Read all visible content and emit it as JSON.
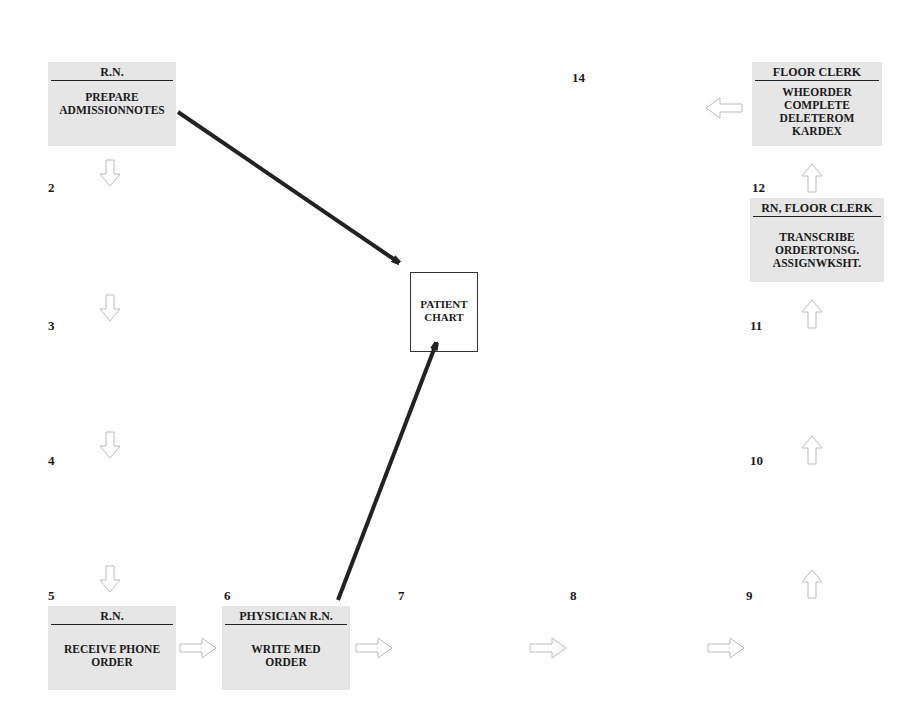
{
  "diagram": {
    "type": "process-flow",
    "steps": [
      {
        "n": "1",
        "role": "R.N.",
        "task": "PREPARE\nADMISSIONNOTES"
      },
      {
        "n": "2"
      },
      {
        "n": "3"
      },
      {
        "n": "4"
      },
      {
        "n": "5",
        "role": "R.N.",
        "task": "RECEIVE PHONE\nORDER"
      },
      {
        "n": "6",
        "role": "PHYSICIAN  R.N.",
        "task": "WRITE MED\nORDER"
      },
      {
        "n": "7"
      },
      {
        "n": "8"
      },
      {
        "n": "9"
      },
      {
        "n": "10"
      },
      {
        "n": "11"
      },
      {
        "n": "12",
        "role": "RN, FLOOR CLERK",
        "task": "TRANSCRIBE\nORDERTONSG.\nASSIGNWKSHT."
      },
      {
        "n": "13",
        "role": "FLOOR CLERK",
        "task": "WHEORDER\nCOMPLETE\nDELETEROM\nKARDEX"
      },
      {
        "n": "14"
      }
    ],
    "patient_chart": {
      "label": "PATIENT\nCHART"
    },
    "colors": {
      "box_fill": "#e6e6e6",
      "arrow_outline": "#bbbbbb",
      "connector": "#222222"
    }
  }
}
